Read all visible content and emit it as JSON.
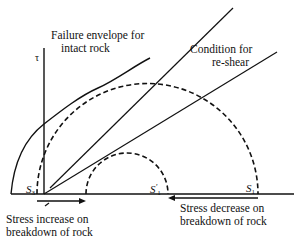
{
  "diagram": {
    "axis_label_tau": "τ",
    "labels": {
      "failure_envelope_line1": "Failure envelope for",
      "failure_envelope_line2": "intact rock",
      "reshear_line1": "Condition for",
      "reshear_line2": "re-shear",
      "stress_increase_line1": "Stress increase on",
      "stress_increase_line2": "breakdown of rock",
      "stress_decrease_line1": "Stress decrease on",
      "stress_decrease_line2": "breakdown of rock"
    },
    "points": {
      "s3": {
        "main": "S",
        "sub": "3",
        "prime": ""
      },
      "s1_prime": {
        "main": "S",
        "sub": "1",
        "prime": "'"
      },
      "s1": {
        "main": "S",
        "sub": "1",
        "prime": ""
      }
    },
    "elements": [
      "sigma-axis",
      "tau-axis",
      "failure-envelope-curve",
      "intact-rock-tangent-line",
      "reshear-line",
      "large-mohr-circle",
      "small-mohr-circle",
      "stress-increase-arrow",
      "stress-decrease-arrow"
    ],
    "colors": {
      "ink": "#111111",
      "background": "#ffffff"
    }
  }
}
